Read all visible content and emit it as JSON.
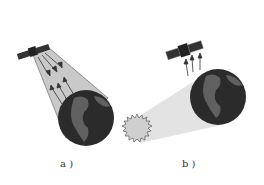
{
  "panels": [
    {
      "id": "a",
      "label": "a )",
      "description": "satellite sensing reflected/emitted radiation from Earth"
    },
    {
      "id": "b",
      "label": "b )",
      "description": "sunlight illuminating Earth, satellite receiving upward radiation"
    }
  ],
  "colors": {
    "earth": "#2b2b2b",
    "land": "#5a5a5a",
    "beam": "#c8c8c8",
    "sun": "#cfcfcf",
    "shadow": "#e6e6e6"
  }
}
